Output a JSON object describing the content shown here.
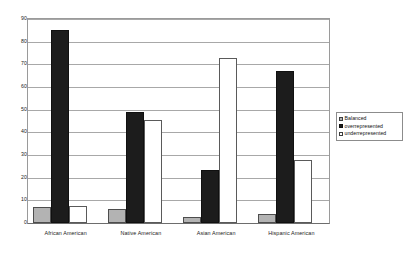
{
  "chart_data": {
    "type": "bar",
    "title": "",
    "xlabel": "",
    "ylabel": "",
    "ylim": [
      0,
      90
    ],
    "ytick_step": 10,
    "yticks": [
      0,
      10,
      20,
      30,
      40,
      50,
      60,
      70,
      80,
      90
    ],
    "grid": true,
    "legend_position": "right",
    "categories": [
      "African American",
      "Native American",
      "Asian American",
      "Hispanic American"
    ],
    "series": [
      {
        "name": "Balanced",
        "color": "#b3b3b3",
        "values": [
          7,
          6,
          2.5,
          4
        ]
      },
      {
        "name": "overrepresented",
        "color": "#1c1c1c",
        "values": [
          85,
          49,
          23.5,
          67
        ]
      },
      {
        "name": "underrepresented",
        "color": "#ffffff",
        "values": [
          7.5,
          45.5,
          73,
          28
        ]
      }
    ]
  },
  "legend": {
    "items": [
      {
        "label": "Balanced"
      },
      {
        "label": "overrepresented"
      },
      {
        "label": "underrepresented"
      }
    ]
  }
}
